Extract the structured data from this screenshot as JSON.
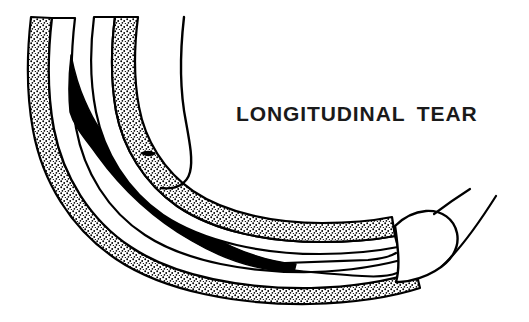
{
  "figure": {
    "title_label": "LONGITUDINAL  TEAR",
    "background_color": "#ffffff",
    "ink_color": "#000000",
    "stipple_color": "#000000",
    "tear_fill_color": "#000000",
    "line_width_px": 2.2
  },
  "annotations": {
    "tear_label": "LONGITUDINAL  TEAR"
  },
  "structures": [
    {
      "name": "outer-stippled-band",
      "fill": "stipple",
      "description": "outermost dotted sheath layer"
    },
    {
      "name": "outer-white-band",
      "fill": "white",
      "description": "clear layer between outer sheath and tear"
    },
    {
      "name": "longitudinal-tear",
      "fill": "solid-black",
      "description": "black wedge-shaped tear running longitudinally"
    },
    {
      "name": "inner-white-band",
      "fill": "white",
      "description": "clear layer inside the tear"
    },
    {
      "name": "inner-stippled-band",
      "fill": "stipple",
      "description": "inner dotted sheath layer"
    },
    {
      "name": "bulbous-insertion",
      "fill": "white",
      "description": "rounded terminal bulb at right"
    },
    {
      "name": "upper-shaft-outline",
      "fill": "white",
      "description": "vertical shaft outline curving to the bulb"
    },
    {
      "name": "tail-line-upper",
      "fill": "none",
      "description": "thin line extending up-right from bulb"
    },
    {
      "name": "tail-line-lower",
      "fill": "none",
      "description": "second thin line extending up-right"
    }
  ]
}
